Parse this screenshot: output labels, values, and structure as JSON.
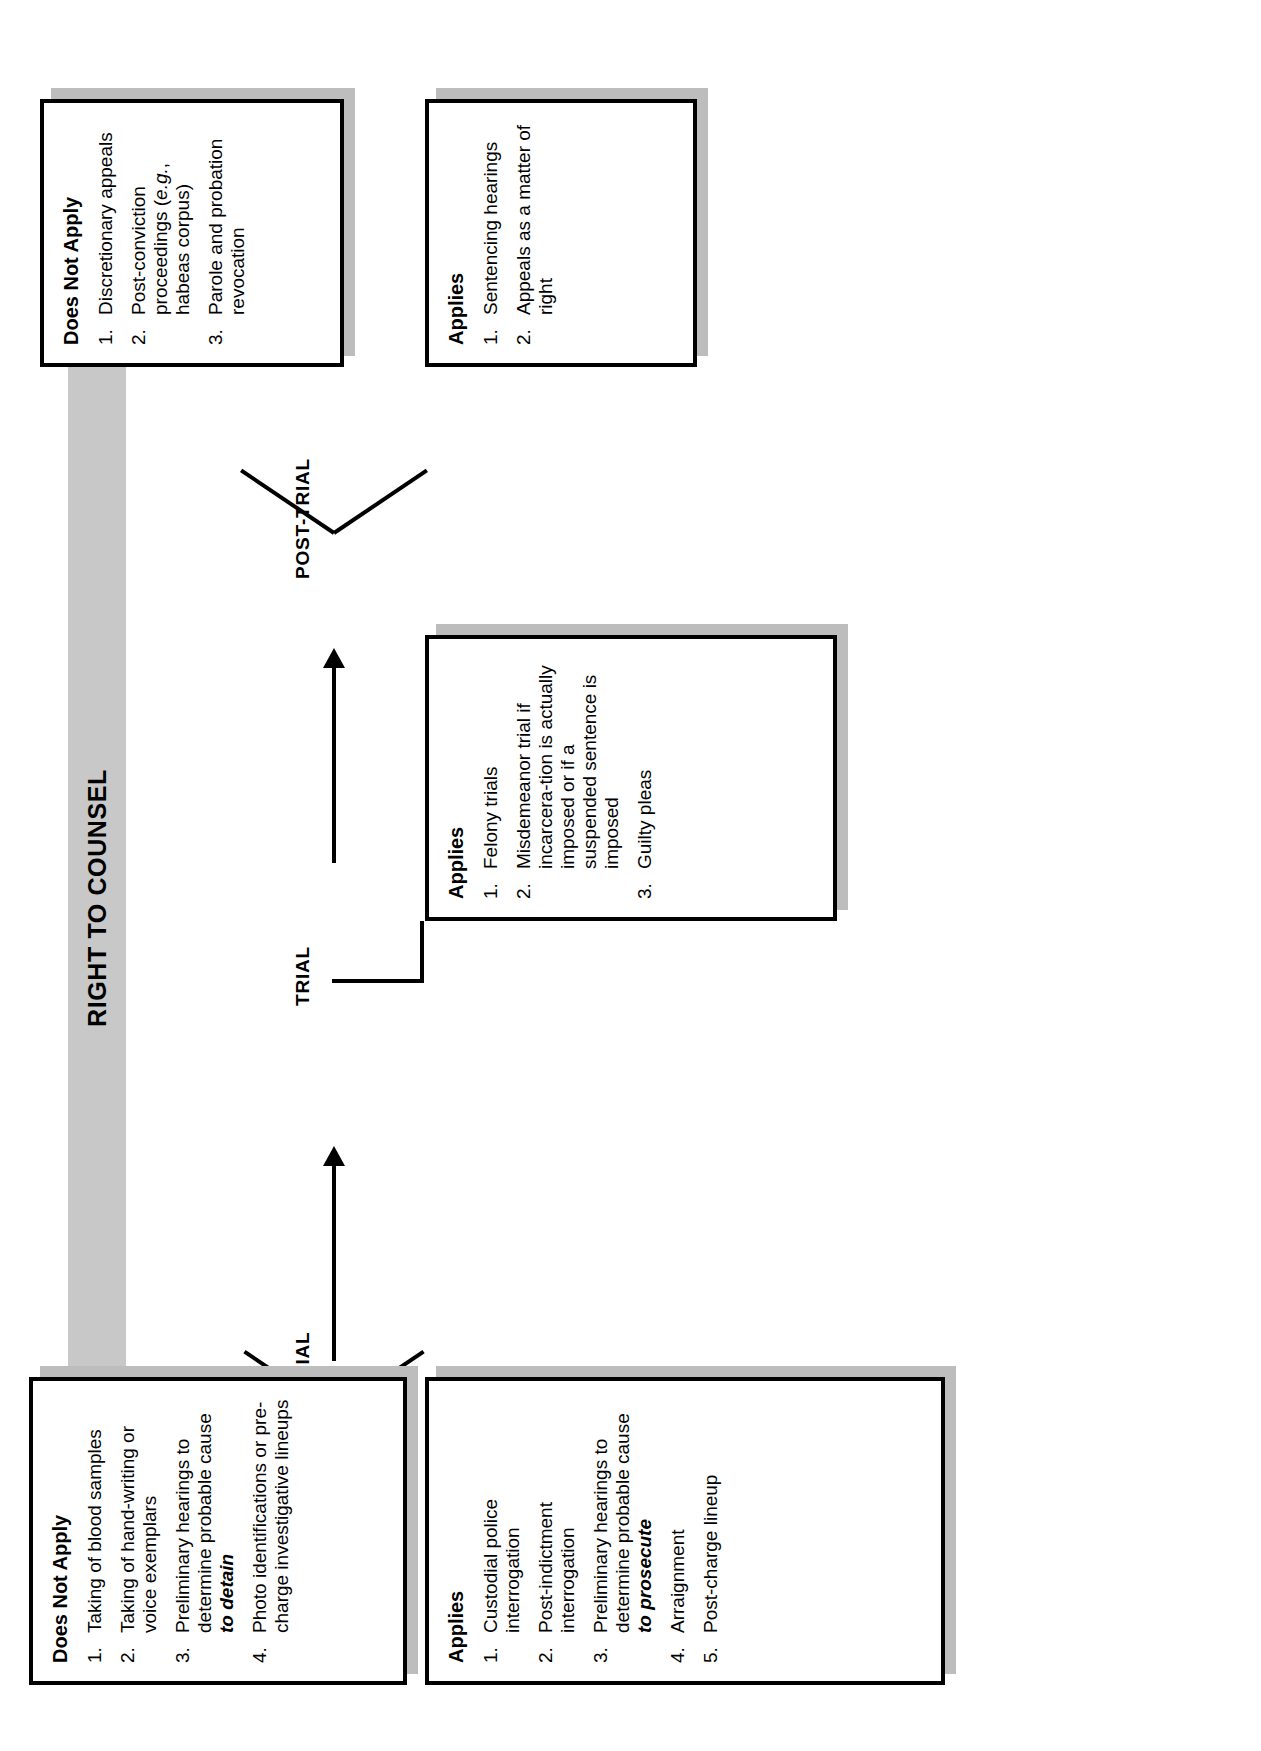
{
  "chart_type": "flowchart",
  "logo": {
    "name": "CMR",
    "subtitle_line1": "APPROACH",
    "subtitle_line2": "CHART"
  },
  "title": "RIGHT TO COUNSEL",
  "stages": [
    {
      "key": "pretrial",
      "label": "PRETRIAL",
      "boxes": [
        {
          "key": "pretrial-applies",
          "title": "Applies",
          "items": [
            {
              "num": "1.",
              "text": "Custodial police interrogation"
            },
            {
              "num": "2.",
              "text": "Post-indictment interrogation"
            },
            {
              "num": "3.",
              "text": "Preliminary hearings to determine probable cause ",
              "emphasis": "to prosecute",
              "emphasis_style": "bold-italic"
            },
            {
              "num": "4.",
              "text": "Arraignment"
            },
            {
              "num": "5.",
              "text": "Post-charge lineup"
            }
          ]
        },
        {
          "key": "pretrial-does-not-apply",
          "title": "Does Not Apply",
          "items": [
            {
              "num": "1.",
              "text": "Taking of blood samples"
            },
            {
              "num": "2.",
              "text": "Taking of hand-writing or voice exemplars"
            },
            {
              "num": "3.",
              "text": "Preliminary hearings to determine probable cause ",
              "emphasis": "to detain",
              "emphasis_style": "bold-italic"
            },
            {
              "num": "4.",
              "text": "Photo identifications or pre-charge investigative lineups"
            }
          ]
        }
      ]
    },
    {
      "key": "trial",
      "label": "TRIAL",
      "boxes": [
        {
          "key": "trial-applies",
          "title": "Applies",
          "items": [
            {
              "num": "1.",
              "text": "Felony trials"
            },
            {
              "num": "2.",
              "text": "Misdemeanor trial if incarcera-tion is actually imposed or if a suspended sentence is imposed"
            },
            {
              "num": "3.",
              "text": "Guilty pleas"
            }
          ]
        }
      ]
    },
    {
      "key": "post-trial",
      "label": "POST-TRIAL",
      "boxes": [
        {
          "key": "post-trial-applies",
          "title": "Applies",
          "items": [
            {
              "num": "1.",
              "text": "Sentencing hearings"
            },
            {
              "num": "2.",
              "text": "Appeals as a matter of right"
            }
          ]
        },
        {
          "key": "post-trial-does-not-apply",
          "title": "Does Not Apply",
          "items": [
            {
              "num": "1.",
              "text": "Discretionary appeals"
            },
            {
              "num": "2.",
              "text": "Post-conviction proceedings (",
              "emphasis": "e.g.",
              "emphasis_style": "italic",
              "text_after": ", habeas corpus)"
            },
            {
              "num": "3.",
              "text": "Parole and probation revocation"
            }
          ]
        }
      ]
    }
  ],
  "colors": {
    "band": "#c8c8c8",
    "shadow": "#bdbdbd",
    "ink": "#000000",
    "logo_fill": "#0b0b0b"
  }
}
